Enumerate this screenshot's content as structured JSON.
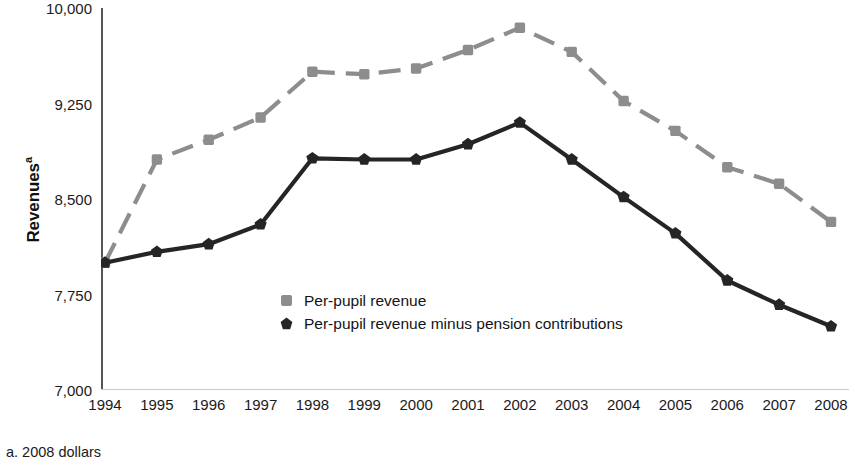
{
  "chart_data": {
    "type": "line",
    "title": "",
    "xlabel": "",
    "ylabel": "Revenues",
    "ylabel_superscript": "a",
    "categories": [
      "1994",
      "1995",
      "1996",
      "1997",
      "1998",
      "1999",
      "2000",
      "2001",
      "2002",
      "2003",
      "2004",
      "2005",
      "2006",
      "2007",
      "2008"
    ],
    "x": [
      1994,
      1995,
      1996,
      1997,
      1998,
      1999,
      2000,
      2001,
      2002,
      2003,
      2004,
      2005,
      2006,
      2007,
      2008
    ],
    "ylim": [
      7000,
      10000
    ],
    "yticks": [
      "7,000",
      "7,750",
      "8,500",
      "9,250",
      "10,000"
    ],
    "ytick_values": [
      7000,
      7750,
      8500,
      9250,
      10000
    ],
    "grid": false,
    "legend_position": "inside-center",
    "series": [
      {
        "name": "Per-pupil revenue",
        "color": "#8d8d8d",
        "marker": "square",
        "linestyle": "dashed",
        "values": [
          8000,
          8810,
          8965,
          9140,
          9500,
          9480,
          9525,
          9670,
          9845,
          9655,
          9270,
          9035,
          8750,
          8620,
          8320
        ]
      },
      {
        "name": "Per-pupil revenue minus pension contributions",
        "color": "#252525",
        "marker": "pentagon",
        "linestyle": "solid",
        "values": [
          8000,
          8085,
          8145,
          8300,
          8820,
          8810,
          8810,
          8930,
          9100,
          8810,
          8515,
          8230,
          7860,
          7670,
          7500
        ]
      }
    ],
    "footnote": "a. 2008 dollars"
  },
  "legend": {
    "items": [
      {
        "label": "Per-pupil revenue"
      },
      {
        "label": "Per-pupil revenue minus pension contributions"
      }
    ]
  },
  "footnote": {
    "text": "a. 2008 dollars"
  }
}
